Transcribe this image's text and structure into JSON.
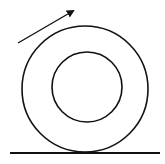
{
  "diagram": {
    "colors": {
      "stroke": "#111111",
      "background": "#ffffff"
    },
    "outer_circle": {
      "cx": 85,
      "cy": 89,
      "r": 63
    },
    "inner_circle": {
      "cx": 87,
      "cy": 87,
      "r": 35
    },
    "ground": {
      "x1": 10,
      "y1": 153,
      "x2": 160,
      "y2": 153
    },
    "arrow": {
      "x1": 18,
      "y1": 43,
      "x2": 73,
      "y2": 11,
      "icon": "arrow-up-right-icon"
    }
  }
}
